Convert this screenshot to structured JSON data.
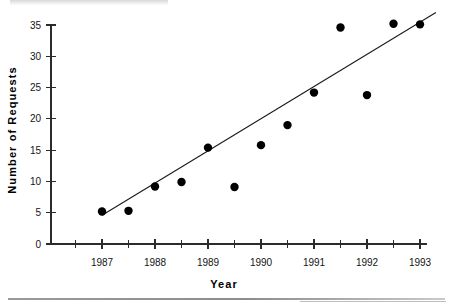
{
  "chart_data": {
    "type": "scatter",
    "title": "",
    "xlabel": "Year",
    "ylabel": "Number  of  Requests",
    "xlim": [
      1986.5,
      1993.5
    ],
    "ylim": [
      0,
      36.5
    ],
    "grid": false,
    "legend": "none",
    "x_ticks": [
      1987,
      1988,
      1989,
      1990,
      1991,
      1992,
      1993
    ],
    "x_tick_labels": [
      "1987",
      "1988",
      "1989",
      "1990",
      "1991",
      "1992",
      "1993"
    ],
    "x_minor_ticks": [
      1986.5,
      1987.5,
      1988.5,
      1989.5,
      1990.5,
      1991.5,
      1992.5
    ],
    "y_ticks": [
      0,
      5,
      10,
      15,
      20,
      25,
      30,
      35
    ],
    "y_tick_labels": [
      "0",
      "5",
      "10",
      "15",
      "20",
      "25",
      "30",
      "35"
    ],
    "series": [
      {
        "name": "Requests",
        "marker": "filled-circle",
        "color": "#000000",
        "x": [
          1987.0,
          1987.5,
          1988.0,
          1988.5,
          1989.0,
          1989.5,
          1990.0,
          1990.5,
          1991.0,
          1991.5,
          1992.0,
          1992.5,
          1993.0
        ],
        "y": [
          5.2,
          5.3,
          9.2,
          9.9,
          15.4,
          9.1,
          15.8,
          19.0,
          24.2,
          34.6,
          23.8,
          35.2,
          35.1
        ]
      }
    ],
    "trend_line": {
      "name": "Linear fit",
      "color": "#1a1a1a",
      "x_start": 1987.0,
      "y_start": 4.6,
      "x_end": 1993.3,
      "y_end": 37.0
    }
  },
  "axis_titles": {
    "x": "Year",
    "y": "Number  of  Requests"
  }
}
